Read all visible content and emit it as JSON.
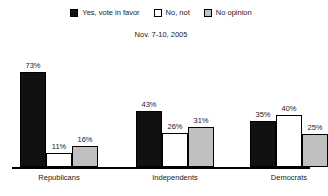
{
  "legend": {
    "items": [
      {
        "label": "Yes, vote in favor",
        "swatch": "#111111",
        "key": "yes"
      },
      {
        "label": "No, not",
        "swatch": "#ffffff",
        "key": "no"
      },
      {
        "label": "No opinion",
        "swatch": "#c0c0c0",
        "key": "no_opinion"
      }
    ]
  },
  "subtitle": "Nov. 7-10, 2005",
  "groups": [
    {
      "category": "Republicans",
      "bars": [
        {
          "series": "Yes, vote in favor",
          "value": 73,
          "label": "73%"
        },
        {
          "series": "No, not",
          "value": 11,
          "label": "11%"
        },
        {
          "series": "No opinion",
          "value": 16,
          "label": "16%"
        }
      ]
    },
    {
      "category": "Independents",
      "bars": [
        {
          "series": "Yes, vote in favor",
          "value": 43,
          "label": "43%"
        },
        {
          "series": "No, not",
          "value": 26,
          "label": "26%"
        },
        {
          "series": "No opinion",
          "value": 31,
          "label": "31%"
        }
      ]
    },
    {
      "category": "Democrats",
      "bars": [
        {
          "series": "Yes, vote in favor",
          "value": 35,
          "label": "35%"
        },
        {
          "series": "No, not",
          "value": 40,
          "label": "40%"
        },
        {
          "series": "No opinion",
          "value": 25,
          "label": "25%"
        }
      ]
    }
  ],
  "chart_data": {
    "type": "bar",
    "title": "",
    "subtitle": "Nov. 7-10, 2005",
    "xlabel": "",
    "ylabel": "",
    "ylim": [
      0,
      80
    ],
    "grid": false,
    "legend_position": "top-center",
    "categories": [
      "Republicans",
      "Independents",
      "Democrats"
    ],
    "series": [
      {
        "name": "Yes, vote in favor",
        "color": "#111111",
        "values": [
          73,
          43,
          35
        ]
      },
      {
        "name": "No, not",
        "color": "#ffffff",
        "values": [
          11,
          26,
          40
        ]
      },
      {
        "name": "No opinion",
        "color": "#c0c0c0",
        "values": [
          16,
          31,
          25
        ]
      }
    ],
    "data_labels": [
      [
        "73%",
        "11%",
        "16%"
      ],
      [
        "43%",
        "26%",
        "31%"
      ],
      [
        "35%",
        "40%",
        "25%"
      ]
    ]
  },
  "render": {
    "group_left_px": [
      20,
      136,
      250
    ],
    "bar_width_px": 26,
    "plot_height_px": 104,
    "value_scale_max": 80
  }
}
